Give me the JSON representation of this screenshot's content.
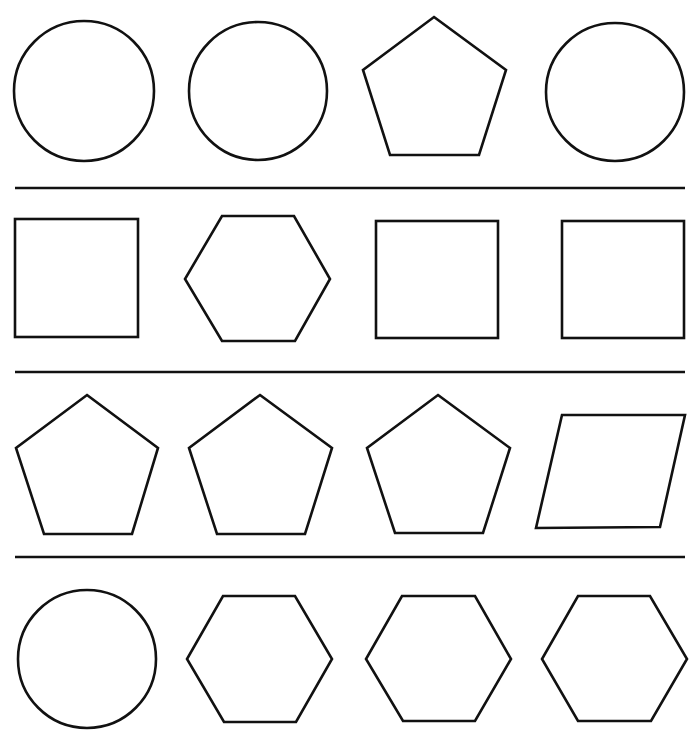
{
  "worksheet": {
    "background": "#ffffff",
    "stroke_color": "#111111",
    "rows": [
      {
        "shapes": [
          {
            "type": "circle",
            "cx": 84,
            "cy": 91,
            "r": 70
          },
          {
            "type": "circle",
            "cx": 258,
            "cy": 91,
            "r": 69
          },
          {
            "type": "pentagon",
            "points": "434,17 506,70 479,155 390,155 363,70"
          },
          {
            "type": "circle",
            "cx": 615,
            "cy": 92,
            "r": 69
          }
        ]
      },
      {
        "shapes": [
          {
            "type": "square",
            "x": 15,
            "y": 219,
            "w": 123,
            "h": 118
          },
          {
            "type": "hexagon",
            "points": "222,216 294,216 330,279 295,341 222,341 185,279"
          },
          {
            "type": "square",
            "x": 376,
            "y": 221,
            "w": 122,
            "h": 117
          },
          {
            "type": "square",
            "x": 562,
            "y": 221,
            "w": 122,
            "h": 117
          }
        ]
      },
      {
        "shapes": [
          {
            "type": "pentagon",
            "points": "87,395 158,448 132,534 44,534 16,448"
          },
          {
            "type": "pentagon",
            "points": "260,395 332,448 305,534 217,534 189,448"
          },
          {
            "type": "pentagon",
            "points": "438,395 510,448 483,533 395,533 367,448"
          },
          {
            "type": "parallelogram",
            "points": "562,415 685,415 660,527 536,528"
          }
        ]
      },
      {
        "shapes": [
          {
            "type": "circle",
            "cx": 87,
            "cy": 659,
            "r": 69
          },
          {
            "type": "hexagon",
            "points": "223,596 295,596 332,659 296,722 224,722 187,659"
          },
          {
            "type": "hexagon",
            "points": "402,596 475,596 511,659 475,721 403,721 366,659"
          },
          {
            "type": "hexagon",
            "points": "578,596 650,596 687,659 651,721 578,721 542,659"
          }
        ]
      }
    ],
    "dividers": [
      {
        "x1": 15,
        "x2": 685,
        "y": 188
      },
      {
        "x1": 15,
        "x2": 685,
        "y": 372
      },
      {
        "x1": 15,
        "x2": 685,
        "y": 557
      }
    ]
  }
}
